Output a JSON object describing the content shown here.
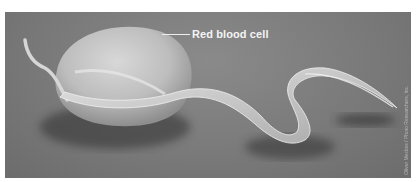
{
  "figure": {
    "style": "grayscale",
    "background_color": "#7a7a7a",
    "border_color": "#ffffff"
  },
  "labels": [
    {
      "text": "Red blood cell",
      "target": "red-blood-cell"
    }
  ],
  "credit": {
    "text": "Oliver Meckes / Photo Researchers, Inc."
  }
}
